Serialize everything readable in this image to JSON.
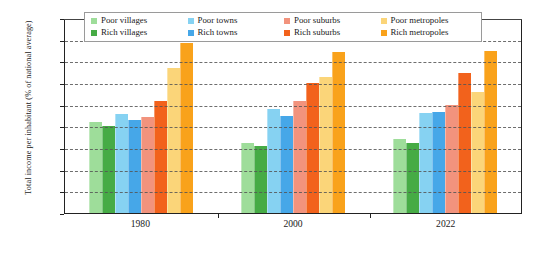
{
  "chart_data": {
    "type": "bar",
    "title": "",
    "xlabel": "",
    "ylabel": "Total income per inhabitant (% of national average)",
    "categories": [
      "1980",
      "2000",
      "2022"
    ],
    "ylim": [
      0,
      180
    ],
    "ytick_values": [
      0,
      20,
      40,
      60,
      80,
      100,
      120,
      140,
      160,
      180
    ],
    "ytick_labels": [
      "0%",
      "20%",
      "40%",
      "60%",
      "80%",
      "100%",
      "120%",
      "140%",
      "160%",
      "180%"
    ],
    "grid": true,
    "legend_position": "top-inside",
    "series": [
      {
        "name": "Poor villages",
        "color": "#9edd9a",
        "values": [
          84,
          65,
          68
        ]
      },
      {
        "name": "Rich villages",
        "color": "#46ab45",
        "values": [
          80,
          62,
          65
        ]
      },
      {
        "name": "Poor towns",
        "color": "#86d2f2",
        "values": [
          91,
          96,
          92
        ]
      },
      {
        "name": "Rich towns",
        "color": "#46a7e8",
        "values": [
          86,
          90,
          93
        ]
      },
      {
        "name": "Poor suburbs",
        "color": "#f2937d",
        "values": [
          89,
          103,
          100
        ]
      },
      {
        "name": "Rich suburbs",
        "color": "#f2621c",
        "values": [
          103,
          120,
          129
        ]
      },
      {
        "name": "Poor metropoles",
        "color": "#fbd579",
        "values": [
          134,
          126,
          112
        ]
      },
      {
        "name": "Rich metropoles",
        "color": "#f9a21b",
        "values": [
          157,
          149,
          150
        ]
      }
    ]
  }
}
